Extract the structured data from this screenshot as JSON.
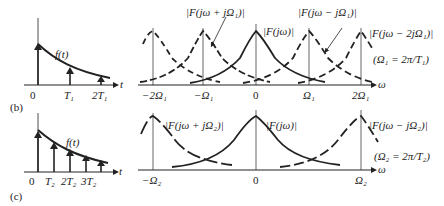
{
  "figure": {
    "panel_b": {
      "label": "(b)",
      "time_plot": {
        "curve_label": "f(t)",
        "axis_label": "t",
        "ticks": [
          "0",
          "T₁",
          "2T₁"
        ]
      },
      "spectrum_plot": {
        "axis_label": "ω",
        "ticks": [
          "−2Ω₁",
          "−Ω₁",
          "0",
          "Ω₁",
          "2Ω₁"
        ],
        "curve_labels": {
          "plus": "|F(jω + jΩ₁)|",
          "center": "|F(jω)|",
          "minus": "|F(jω − jΩ₁)|",
          "minus2": "|F(jω − 2jΩ₁)|"
        },
        "note": "(Ω₁ = 2π/T₁)"
      }
    },
    "panel_c": {
      "label": "(c)",
      "time_plot": {
        "curve_label": "f(t)",
        "axis_label": "t",
        "ticks": [
          "0",
          "T₂",
          "2T₂",
          "3T₂"
        ]
      },
      "spectrum_plot": {
        "axis_label": "ω",
        "ticks": [
          "−Ω₂",
          "0",
          "Ω₂"
        ],
        "curve_labels": {
          "plus": "|F(jω + jΩ₂)|",
          "center": "|F(jω)|",
          "minus": "|F(jω − jΩ₂)|"
        },
        "note": "(Ω₂ = 2π/T₂)"
      }
    }
  }
}
